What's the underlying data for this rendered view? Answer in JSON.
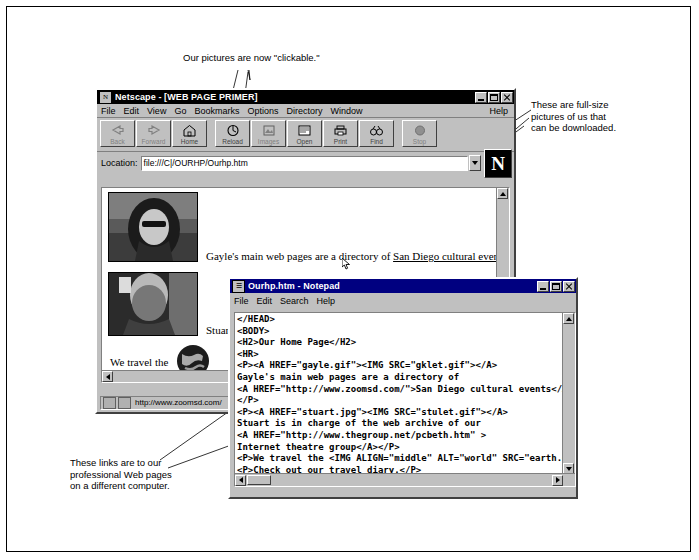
{
  "annotations": {
    "clickable": "Our pictures are now \"clickable.\"",
    "fullsize": "These are full-size\npictures of us that\ncan be downloaded.",
    "links": "These links are to our\nprofessional Web pages\non a different computer."
  },
  "netscape": {
    "title": "Netscape - [WEB PAGE PRIMER]",
    "icon_glyph": "N",
    "window_buttons": [
      "minimize",
      "maximize",
      "close"
    ],
    "menus": [
      "File",
      "Edit",
      "View",
      "Go",
      "Bookmarks",
      "Options",
      "Directory",
      "Window"
    ],
    "help_menu": "Help",
    "toolbar": [
      {
        "label": "Back",
        "icon": "back-arrow-icon",
        "enabled": false
      },
      {
        "label": "Forward",
        "icon": "forward-arrow-icon",
        "enabled": false
      },
      {
        "label": "Home",
        "icon": "home-icon",
        "enabled": true
      },
      {
        "label": "Reload",
        "icon": "reload-icon",
        "enabled": true
      },
      {
        "label": "Images",
        "icon": "images-icon",
        "enabled": true
      },
      {
        "label": "Open",
        "icon": "open-icon",
        "enabled": true
      },
      {
        "label": "Print",
        "icon": "printer-icon",
        "enabled": true
      },
      {
        "label": "Find",
        "icon": "binoculars-icon",
        "enabled": true
      },
      {
        "label": "Stop",
        "icon": "stop-icon",
        "enabled": false
      }
    ],
    "location_label": "Location:",
    "location_value": "file:///C|/OURHP/Ourhp.htm",
    "page": {
      "line1_prefix": "Gayle's main web pages are a directory of ",
      "line1_link": "San Diego cultural events",
      "line2": "Stuart is",
      "line3": "We travel the",
      "images": [
        "gklet.gif",
        "stulet.gif",
        "earth.gif"
      ]
    },
    "status_url": "http://www.zoomsd.com/"
  },
  "notepad": {
    "title": "Ourhp.htm - Notepad",
    "icon_glyph": "☰",
    "menus": [
      "File",
      "Edit",
      "Search",
      "Help"
    ],
    "content": "</HEAD>\n<BODY>\n<H2>Our Home Page</H2>\n<HR>\n<P><A HREF=\"gayle.gif\"><IMG SRC=\"gklet.gif\"></A>\nGayle's main web pages are a directory of\n<A HREF=\"http://www.zoomsd.com/\">San Diego cultural events</A>\n</P>\n<P><A HREF=\"stuart.jpg\"><IMG SRC=\"stulet.gif\"></A>\nStuart is in charge of the web archive of our\n<A HREF=\"http://www.thegroup.net/pcbeth.htm\" >\nInternet theatre group</A></P>\n<P>We travel the <IMG ALIGN=\"middle\" ALT=\"world\" SRC=\"earth.gif\n<P>Check out our travel diary.</P>\n<OL>\n<LI>"
  }
}
